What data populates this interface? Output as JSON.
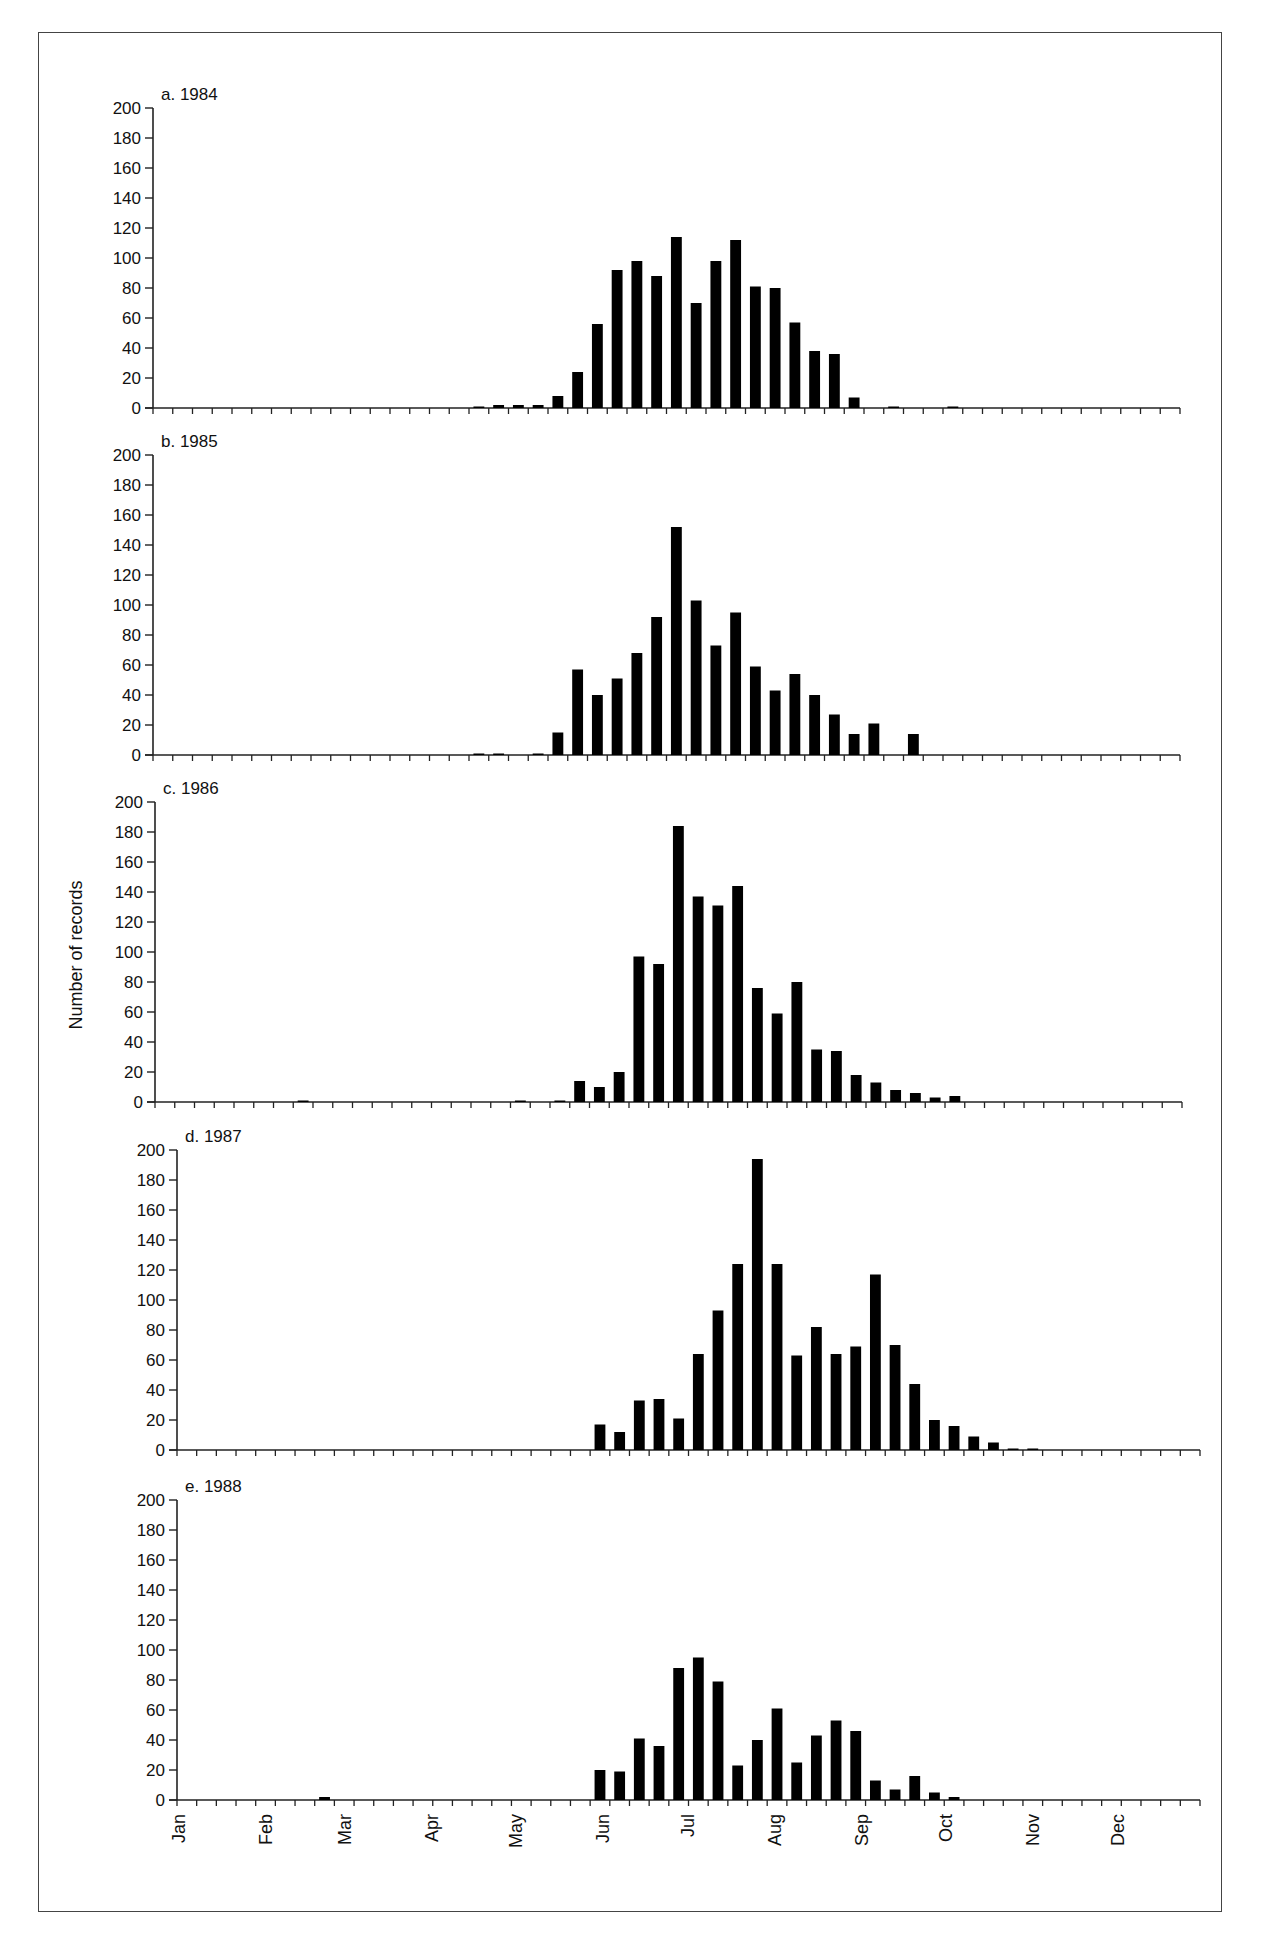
{
  "figure": {
    "ylabel": "Number of records",
    "months": [
      "Jan",
      "Feb",
      "Mar",
      "Apr",
      "May",
      "Jun",
      "Jul",
      "Aug",
      "Sep",
      "Oct",
      "Nov",
      "Dec"
    ]
  },
  "chart_data": [
    {
      "type": "bar",
      "title": "a.  1984",
      "xlabel": "",
      "ylabel": "Number of records",
      "ylim": [
        0,
        200
      ],
      "yticks": [
        0,
        20,
        40,
        60,
        80,
        100,
        120,
        140,
        160,
        180,
        200
      ],
      "x_unit": "week of year (1-52)",
      "x_tick_labels": [
        "Jan",
        "Feb",
        "Mar",
        "Apr",
        "May",
        "Jun",
        "Jul",
        "Aug",
        "Sep",
        "Oct",
        "Nov",
        "Dec"
      ],
      "values": [
        0,
        0,
        0,
        0,
        0,
        0,
        0,
        0,
        0,
        0,
        0,
        0,
        0,
        0,
        0,
        0,
        1,
        2,
        2,
        2,
        8,
        24,
        56,
        92,
        98,
        88,
        114,
        70,
        98,
        112,
        81,
        80,
        57,
        38,
        36,
        7,
        0,
        1,
        0,
        0,
        1,
        0,
        0,
        0,
        0,
        0,
        0,
        0,
        0,
        0,
        0,
        0
      ]
    },
    {
      "type": "bar",
      "title": "b.  1985",
      "xlabel": "",
      "ylabel": "Number of records",
      "ylim": [
        0,
        200
      ],
      "yticks": [
        0,
        20,
        40,
        60,
        80,
        100,
        120,
        140,
        160,
        180,
        200
      ],
      "x_unit": "week of year (1-52)",
      "x_tick_labels": [
        "Jan",
        "Feb",
        "Mar",
        "Apr",
        "May",
        "Jun",
        "Jul",
        "Aug",
        "Sep",
        "Oct",
        "Nov",
        "Dec"
      ],
      "values": [
        0,
        0,
        0,
        0,
        0,
        0,
        0,
        0,
        0,
        0,
        0,
        0,
        0,
        0,
        0,
        0,
        1,
        1,
        0,
        1,
        15,
        57,
        40,
        51,
        68,
        92,
        152,
        103,
        73,
        95,
        59,
        43,
        54,
        40,
        27,
        14,
        21,
        0,
        14,
        0,
        0,
        0,
        0,
        0,
        0,
        0,
        0,
        0,
        0,
        0,
        0,
        0
      ]
    },
    {
      "type": "bar",
      "title": "c.  1986",
      "xlabel": "",
      "ylabel": "Number of records",
      "ylim": [
        0,
        200
      ],
      "yticks": [
        0,
        20,
        40,
        60,
        80,
        100,
        120,
        140,
        160,
        180,
        200
      ],
      "x_unit": "week of year (1-52)",
      "x_tick_labels": [
        "Jan",
        "Feb",
        "Mar",
        "Apr",
        "May",
        "Jun",
        "Jul",
        "Aug",
        "Sep",
        "Oct",
        "Nov",
        "Dec"
      ],
      "values": [
        0,
        0,
        0,
        0,
        0,
        0,
        0,
        1,
        0,
        0,
        0,
        0,
        0,
        0,
        0,
        0,
        0,
        0,
        1,
        0,
        1,
        14,
        10,
        20,
        97,
        92,
        184,
        137,
        131,
        144,
        76,
        59,
        80,
        35,
        34,
        18,
        13,
        8,
        6,
        3,
        4,
        0,
        0,
        0,
        0,
        0,
        0,
        0,
        0,
        0,
        0,
        0
      ]
    },
    {
      "type": "bar",
      "title": "d.  1987",
      "xlabel": "",
      "ylabel": "Number of records",
      "ylim": [
        0,
        200
      ],
      "yticks": [
        0,
        20,
        40,
        60,
        80,
        100,
        120,
        140,
        160,
        180,
        200
      ],
      "x_unit": "week of year (1-52)",
      "x_tick_labels": [
        "Jan",
        "Feb",
        "Mar",
        "Apr",
        "May",
        "Jun",
        "Jul",
        "Aug",
        "Sep",
        "Oct",
        "Nov",
        "Dec"
      ],
      "values": [
        0,
        0,
        0,
        0,
        0,
        0,
        0,
        0,
        0,
        0,
        0,
        0,
        0,
        0,
        0,
        0,
        0,
        0,
        0,
        0,
        0,
        17,
        12,
        33,
        34,
        21,
        64,
        93,
        124,
        194,
        124,
        63,
        82,
        64,
        69,
        117,
        70,
        44,
        20,
        16,
        9,
        5,
        1,
        1,
        0,
        0,
        0,
        0,
        0,
        0,
        0,
        0
      ]
    },
    {
      "type": "bar",
      "title": "e.  1988",
      "xlabel": "",
      "ylabel": "Number of records",
      "ylim": [
        0,
        200
      ],
      "yticks": [
        0,
        20,
        40,
        60,
        80,
        100,
        120,
        140,
        160,
        180,
        200
      ],
      "x_unit": "week of year (1-52)",
      "x_tick_labels": [
        "Jan",
        "Feb",
        "Mar",
        "Apr",
        "May",
        "Jun",
        "Jul",
        "Aug",
        "Sep",
        "Oct",
        "Nov",
        "Dec"
      ],
      "values": [
        0,
        0,
        0,
        0,
        0,
        0,
        0,
        2,
        0,
        0,
        0,
        0,
        0,
        0,
        0,
        0,
        0,
        0,
        0,
        0,
        0,
        20,
        19,
        41,
        36,
        88,
        95,
        79,
        23,
        40,
        61,
        25,
        43,
        53,
        46,
        13,
        7,
        16,
        5,
        2,
        0,
        0,
        0,
        0,
        0,
        0,
        0,
        0,
        0,
        0,
        0,
        0
      ]
    }
  ],
  "layout": {
    "panels": [
      {
        "x0": 153,
        "x1": 1180,
        "y0": 408,
        "ytop": 108
      },
      {
        "x0": 153,
        "x1": 1180,
        "y0": 755,
        "ytop": 455
      },
      {
        "x0": 155,
        "x1": 1182,
        "y0": 1102,
        "ytop": 802
      },
      {
        "x0": 177,
        "x1": 1200,
        "y0": 1450,
        "ytop": 1150
      },
      {
        "x0": 177,
        "x1": 1200,
        "y0": 1800,
        "ytop": 1500
      }
    ],
    "bar_color": "#000000",
    "axis_color": "#222222"
  }
}
